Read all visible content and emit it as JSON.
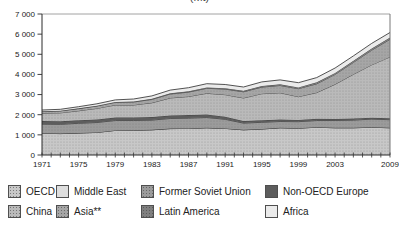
{
  "title_fragment": "(Mt)",
  "chart_data": {
    "type": "area",
    "stacked": true,
    "title": "(Mt)",
    "xlabel": "",
    "ylabel": "",
    "ylim": [
      0,
      7000
    ],
    "grid": false,
    "legend_position": "bottom",
    "x": [
      1971,
      1973,
      1975,
      1977,
      1979,
      1981,
      1983,
      1985,
      1987,
      1989,
      1991,
      1993,
      1995,
      1997,
      1999,
      2001,
      2003,
      2005,
      2007,
      2009
    ],
    "xtick_labels": [
      1971,
      1975,
      1979,
      1983,
      1987,
      1991,
      1995,
      1999,
      2003,
      2009
    ],
    "ytick_labels": [
      "0",
      "1 000",
      "2 000",
      "3 000",
      "4 000",
      "5 000",
      "6 000",
      "7 000"
    ],
    "series": [
      {
        "name": "OECD",
        "color": "#c8c8c8",
        "stipple": true,
        "values": [
          1080,
          1060,
          1090,
          1120,
          1220,
          1230,
          1250,
          1310,
          1320,
          1350,
          1320,
          1250,
          1290,
          1350,
          1330,
          1380,
          1350,
          1350,
          1380,
          1350
        ]
      },
      {
        "name": "Middle East",
        "color": "#dedede",
        "stipple": false,
        "values": [
          2,
          2,
          2,
          2,
          2,
          2,
          2,
          2,
          2,
          2,
          2,
          2,
          2,
          2,
          2,
          2,
          2,
          2,
          2,
          2
        ]
      },
      {
        "name": "Former Soviet Union",
        "color": "#9b9b9b",
        "stipple": true,
        "values": [
          450,
          460,
          480,
          490,
          490,
          480,
          480,
          500,
          510,
          510,
          450,
          330,
          330,
          310,
          320,
          330,
          360,
          380,
          400,
          400
        ]
      },
      {
        "name": "Non-OECD Europe",
        "color": "#5d5d5d",
        "stipple": false,
        "values": [
          150,
          150,
          150,
          150,
          150,
          150,
          150,
          150,
          150,
          150,
          130,
          100,
          100,
          95,
          90,
          85,
          80,
          75,
          72,
          70
        ]
      },
      {
        "name": "China",
        "color": "#bababa",
        "stipple": true,
        "values": [
          390,
          420,
          470,
          550,
          620,
          620,
          710,
          870,
          920,
          1050,
          1090,
          1150,
          1320,
          1330,
          1150,
          1300,
          1720,
          2200,
          2620,
          3050
        ]
      },
      {
        "name": "Asia**",
        "color": "#a6a6a6",
        "stipple": true,
        "values": [
          90,
          95,
          110,
          120,
          130,
          150,
          170,
          195,
          220,
          250,
          280,
          305,
          330,
          365,
          400,
          440,
          490,
          590,
          730,
          870
        ]
      },
      {
        "name": "Latin America",
        "color": "#7f7f7f",
        "stipple": true,
        "values": [
          10,
          12,
          15,
          18,
          22,
          26,
          30,
          34,
          38,
          42,
          46,
          50,
          55,
          60,
          65,
          70,
          75,
          80,
          85,
          90
        ]
      },
      {
        "name": "Africa",
        "color": "#ebebeb",
        "stipple": false,
        "values": [
          60,
          70,
          80,
          90,
          100,
          120,
          140,
          160,
          180,
          185,
          180,
          190,
          200,
          215,
          230,
          235,
          240,
          245,
          250,
          250
        ]
      }
    ]
  }
}
